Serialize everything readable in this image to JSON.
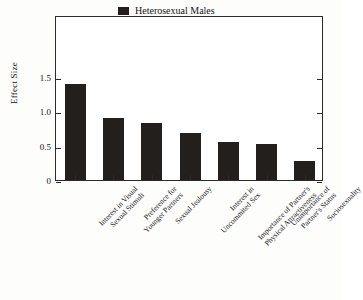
{
  "chart_data": {
    "type": "bar",
    "title": "",
    "subtitle": "",
    "xlabel": "",
    "ylabel": "Effect Size",
    "ylim": [
      0,
      1.5
    ],
    "yticks": [
      "0",
      "0.5",
      "1.0",
      "1.5"
    ],
    "ytick_values": [
      0,
      0.5,
      1.0,
      1.5
    ],
    "grid": false,
    "legend_position": "top-right",
    "legend": [
      "Heterosexual Males"
    ],
    "bar_color": "#221f1d",
    "categories": [
      "Interest in Visual Sexual Stimuli",
      "Preference for Younger Partners",
      "Sexual Jealousy",
      "Interest in Uncommited Sex",
      "Importance of Partner's Physical Attractiveness",
      "Unimportance of Partner's Status",
      "Sociosexuality"
    ],
    "category_lines": [
      [
        "Interest in Visual",
        "Sexual Stimuli"
      ],
      [
        "Preference for",
        "Younger Partners"
      ],
      [
        "Sexual Jealousy"
      ],
      [
        "Interest in",
        "Uncommited Sex"
      ],
      [
        "Importance of Partner's",
        "Physical Attractiveness"
      ],
      [
        "Unimportance of",
        "Partner's Status"
      ],
      [
        "Sociosexuality"
      ]
    ],
    "series": [
      {
        "name": "Heterosexual Males",
        "values": [
          1.4,
          0.9,
          0.83,
          0.69,
          0.56,
          0.52,
          0.28
        ]
      }
    ]
  }
}
